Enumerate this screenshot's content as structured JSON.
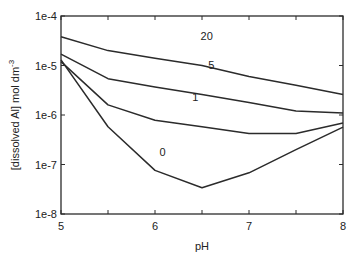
{
  "chart_data": {
    "type": "line",
    "title": "",
    "xlabel": "pH",
    "ylabel": "[dissolved Al]  mol dm",
    "ylabel_superscript": "-3",
    "xlim": [
      5,
      8
    ],
    "ylim": [
      1e-08,
      0.0001
    ],
    "yscale": "log",
    "grid": false,
    "legend": "none (inline curve labels)",
    "x_ticks": [
      5,
      5.5,
      6,
      6.5,
      7,
      7.5,
      8
    ],
    "x_tick_labels": [
      "5",
      "",
      "6",
      "",
      "7",
      "",
      "8"
    ],
    "y_ticks": [
      1e-08,
      1e-07,
      1e-06,
      1e-05,
      0.0001
    ],
    "y_tick_labels": [
      "1e-8",
      "1e-7",
      "1e-6",
      "1e-5",
      "1e-4"
    ],
    "x": [
      5,
      5.5,
      6,
      6.5,
      7,
      7.5,
      8
    ],
    "series": [
      {
        "name": "20",
        "values": [
          3.8e-05,
          2e-05,
          1.4e-05,
          1e-05,
          6e-06,
          4e-06,
          2.6e-06
        ],
        "label_pos": [
          6.55,
          3.3e-05
        ]
      },
      {
        "name": "5",
        "values": [
          1.7e-05,
          5.4e-06,
          3.7e-06,
          2.6e-06,
          1.8e-06,
          1.2e-06,
          1.1e-06
        ],
        "label_pos": [
          6.6,
          8.5e-06
        ]
      },
      {
        "name": "1",
        "values": [
          1.2e-05,
          1.6e-06,
          7.8e-07,
          5.8e-07,
          4.2e-07,
          4.2e-07,
          6.9e-07
        ],
        "label_pos": [
          6.43,
          1.9e-06
        ]
      },
      {
        "name": "0",
        "values": [
          1.3e-05,
          5.8e-07,
          7.6e-08,
          3.4e-08,
          6.8e-08,
          2e-07,
          5.7e-07
        ],
        "label_pos": [
          6.08,
          1.5e-07
        ]
      }
    ]
  },
  "style": {
    "line_color": "#2b2b2b",
    "axis_color": "#2b2b2b",
    "background": "#ffffff"
  }
}
